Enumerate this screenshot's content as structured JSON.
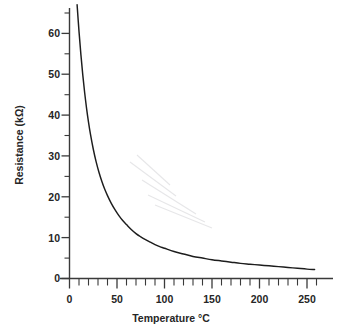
{
  "chart_data": {
    "type": "line",
    "title": "",
    "xlabel": "Temperature °C",
    "ylabel": "Resistance (kΩ)",
    "xlim": [
      0,
      270
    ],
    "ylim": [
      0,
      67
    ],
    "grid": false,
    "legend": false,
    "x_ticks_major": [
      0,
      50,
      100,
      150,
      200,
      250
    ],
    "x_tick_labels": [
      "0",
      "50",
      "100",
      "150",
      "200",
      "250"
    ],
    "x_ticks_minor": [
      10,
      20,
      30,
      40,
      60,
      70,
      80,
      90,
      110,
      120,
      130,
      140,
      160,
      170,
      180,
      190,
      210,
      220,
      230,
      240,
      260
    ],
    "y_ticks_major": [
      0,
      10,
      20,
      30,
      40,
      50,
      60
    ],
    "y_tick_labels": [
      "0",
      "10",
      "20",
      "30",
      "40",
      "50",
      "60"
    ],
    "y_ticks_minor": [
      5,
      15,
      25,
      35,
      45,
      55,
      65
    ],
    "series": [
      {
        "name": "Thermistor resistance",
        "color": "#1d1d1d",
        "x": [
          8,
          10,
          12,
          14,
          16,
          18,
          20,
          22,
          25,
          28,
          31,
          34,
          37,
          40,
          44,
          48,
          52,
          56,
          60,
          65,
          70,
          75,
          80,
          85,
          90,
          95,
          100,
          110,
          120,
          130,
          140,
          150,
          160,
          170,
          180,
          190,
          200,
          210,
          220,
          230,
          240,
          250,
          258
        ],
        "y": [
          67.0,
          60.5,
          54.8,
          49.8,
          45.4,
          41.6,
          38.3,
          35.4,
          31.7,
          28.6,
          26.0,
          23.8,
          21.9,
          20.3,
          18.4,
          16.8,
          15.4,
          14.2,
          13.2,
          12.0,
          11.0,
          10.2,
          9.5,
          8.9,
          8.3,
          7.8,
          7.4,
          6.6,
          6.0,
          5.4,
          5.0,
          4.6,
          4.3,
          4.0,
          3.7,
          3.5,
          3.3,
          3.1,
          2.9,
          2.7,
          2.5,
          2.3,
          2.2
        ]
      }
    ]
  },
  "axes": {
    "y_title": "Resistance (kΩ)",
    "x_title": "Temperature °C"
  }
}
